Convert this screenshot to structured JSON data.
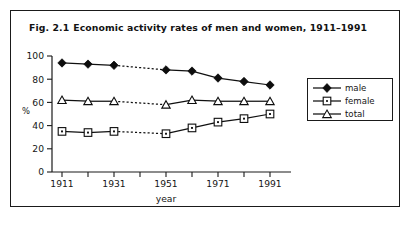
{
  "figure": {
    "number": "Fig. 2.1",
    "title": "Economic activity rates of men and women, 1911–1991"
  },
  "chart_data": {
    "type": "line",
    "title": "Economic activity rates of men and women, 1911–1991",
    "xlabel": "year",
    "ylabel": "%",
    "x": [
      1911,
      1921,
      1931,
      1951,
      1961,
      1971,
      1981,
      1991
    ],
    "xlim": [
      1906,
      1996
    ],
    "ylim": [
      0,
      100
    ],
    "xticks": [
      1911,
      1921,
      1931,
      1941,
      1951,
      1961,
      1971,
      1981,
      1991
    ],
    "xticklabels": [
      "1911",
      "",
      "1931",
      "",
      "1951",
      "",
      "1971",
      "",
      "1991"
    ],
    "yticks": [
      0,
      20,
      40,
      60,
      80,
      100
    ],
    "yticklabels": [
      "0",
      "20",
      "40",
      "60",
      "80",
      "100"
    ],
    "grid": false,
    "legend_position": "right",
    "gap_note": "dashed segment between 1931 and 1951 (no 1941 census)",
    "series": [
      {
        "name": "male",
        "marker": "filled-diamond",
        "values": [
          94,
          93,
          92,
          88,
          87,
          81,
          78,
          75
        ]
      },
      {
        "name": "female",
        "marker": "open-square-dot",
        "values": [
          35,
          34,
          35,
          33,
          38,
          43,
          46,
          50
        ]
      },
      {
        "name": "total",
        "marker": "open-triangle",
        "values": [
          62,
          61,
          61,
          58,
          62,
          61,
          61,
          61
        ]
      }
    ]
  },
  "legend": {
    "items": [
      {
        "label": "male",
        "marker": "filled-diamond"
      },
      {
        "label": "female",
        "marker": "open-square-dot"
      },
      {
        "label": "total",
        "marker": "open-triangle"
      }
    ]
  },
  "axes": {
    "y_axis_title": "%",
    "x_axis_title": "year",
    "y_tick_labels": [
      "100",
      "80",
      "60",
      "40",
      "20",
      "0"
    ],
    "x_tick_labels": [
      "1911",
      "1931",
      "1951",
      "1971",
      "1991"
    ]
  },
  "colors": {
    "ink": "#101010",
    "frame": "#1a1a1a",
    "paper": "#ffffff"
  }
}
